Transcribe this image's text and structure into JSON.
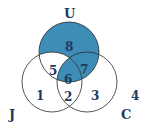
{
  "diagram": {
    "type": "venn-3",
    "colors": {
      "shaded": "#3e8db6",
      "outline": "#2a2a2a",
      "text": "#1d3c5e",
      "background": "#ffffff"
    },
    "sets": [
      {
        "id": "U",
        "label": "U"
      },
      {
        "id": "J",
        "label": "J"
      },
      {
        "id": "C",
        "label": "C"
      }
    ],
    "regions": [
      {
        "id": "r1",
        "label": "1",
        "sets": [
          "J"
        ],
        "shaded": false
      },
      {
        "id": "r2",
        "label": "2",
        "sets": [
          "J",
          "C"
        ],
        "shaded": false
      },
      {
        "id": "r3",
        "label": "3",
        "sets": [
          "C"
        ],
        "shaded": false
      },
      {
        "id": "r4",
        "label": "4",
        "sets": [],
        "shaded": false
      },
      {
        "id": "r5",
        "label": "5",
        "sets": [
          "U",
          "J"
        ],
        "shaded": false
      },
      {
        "id": "r6",
        "label": "6",
        "sets": [
          "U",
          "J",
          "C"
        ],
        "shaded": true
      },
      {
        "id": "r7",
        "label": "7",
        "sets": [
          "U",
          "C"
        ],
        "shaded": true
      },
      {
        "id": "r8",
        "label": "8",
        "sets": [
          "U"
        ],
        "shaded": true
      }
    ]
  }
}
